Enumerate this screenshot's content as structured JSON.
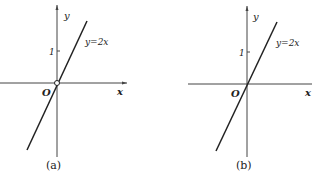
{
  "figure_a": {
    "caption": "(a)",
    "x_label": "x",
    "y_label": "y",
    "origin_label": "O",
    "tick_label": "1",
    "line_label": "y=2x",
    "origin_marker": "open-circle"
  },
  "figure_b": {
    "caption": "(b)",
    "x_label": "x",
    "y_label": "y",
    "origin_label": "O",
    "tick_label": "1",
    "line_label": "y=2x",
    "origin_marker": "none"
  },
  "colors": {
    "ink": "#222222",
    "background": "#ffffff"
  }
}
